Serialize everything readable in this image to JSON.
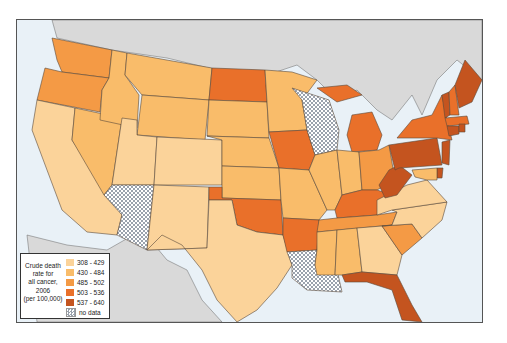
{
  "map": {
    "title": "Crude death rate for all cancer, 2006 (per 100,000)",
    "background": {
      "land_outside": "#d8d8d8",
      "water": "#e9f1f7",
      "frame_border": "#555555"
    }
  },
  "legend": {
    "title_lines": [
      "Crude death",
      "rate for",
      "all cancer,",
      "2006",
      "(per 100,000)"
    ],
    "items": [
      {
        "label": "308 - 429",
        "color": "#fbd39a"
      },
      {
        "label": "430 - 484",
        "color": "#f9bc6a"
      },
      {
        "label": "485 - 502",
        "color": "#f49a45"
      },
      {
        "label": "503 - 536",
        "color": "#e9702a"
      },
      {
        "label": "537 - 640",
        "color": "#c4541f"
      },
      {
        "label": "no data",
        "color": "checker"
      }
    ]
  },
  "chart_data": {
    "type": "choropleth",
    "title": "Crude death rate for all cancer, 2006 (per 100,000)",
    "classes": [
      "308 - 429",
      "430 - 484",
      "485 - 502",
      "503 - 536",
      "537 - 640",
      "no data"
    ],
    "states": {
      "WA": "485 - 502",
      "OR": "485 - 502",
      "CA": "308 - 429",
      "NV": "430 - 484",
      "ID": "430 - 484",
      "MT": "430 - 484",
      "WY": "430 - 484",
      "UT": "308 - 429",
      "CO": "308 - 429",
      "AZ": "no data",
      "NM": "308 - 429",
      "ND": "503 - 536",
      "SD": "430 - 484",
      "NE": "430 - 484",
      "KS": "430 - 484",
      "OK": "503 - 536",
      "TX": "308 - 429",
      "MN": "430 - 484",
      "IA": "503 - 536",
      "MO": "430 - 484",
      "AR": "503 - 536",
      "LA": "no data",
      "WI": "no data",
      "IL": "430 - 484",
      "MI": "503 - 536",
      "IN": "430 - 484",
      "OH": "485 - 502",
      "KY": "503 - 536",
      "TN": "485 - 502",
      "MS": "430 - 484",
      "AL": "430 - 484",
      "GA": "308 - 429",
      "FL": "537 - 640",
      "SC": "485 - 502",
      "NC": "308 - 429",
      "VA": "308 - 429",
      "WV": "537 - 640",
      "PA": "537 - 640",
      "NY": "503 - 536",
      "VT": "537 - 640",
      "NH": "503 - 536",
      "ME": "537 - 640",
      "MA": "503 - 536",
      "CT": "537 - 640",
      "RI": "537 - 640",
      "NJ": "537 - 640",
      "DE": "537 - 640",
      "MD": "430 - 484"
    }
  }
}
